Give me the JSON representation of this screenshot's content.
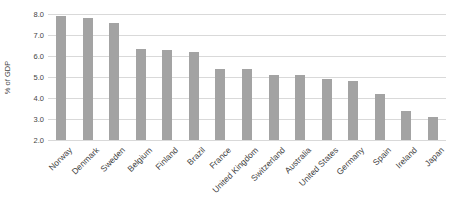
{
  "chart_data": {
    "type": "bar",
    "title": "",
    "xlabel": "",
    "ylabel": "% of GDP",
    "categories": [
      "Norway",
      "Denmark",
      "Sweden",
      "Belgium",
      "Finland",
      "Brazil",
      "France",
      "United Kingdom",
      "Switzerland",
      "Australia",
      "United States",
      "Germany",
      "Spain",
      "Ireland",
      "Japan"
    ],
    "values": [
      7.9,
      7.8,
      7.55,
      6.35,
      6.3,
      6.2,
      5.4,
      5.4,
      5.1,
      5.1,
      4.9,
      4.8,
      4.2,
      3.4,
      3.1
    ],
    "ylim": [
      2.0,
      8.0
    ],
    "ytick_step": 1.0,
    "ytick_labels": [
      "8.0",
      "7.0",
      "6.0",
      "5.0",
      "4.0",
      "3.0",
      "2.0"
    ],
    "grid": true,
    "legend": "none",
    "bar_color": "#a3a3a3",
    "gridline_color": "#d9d9d9",
    "axis_text_color": "#444444",
    "category_text_color": "#3f3f3f",
    "background_color": "#ffffff"
  }
}
